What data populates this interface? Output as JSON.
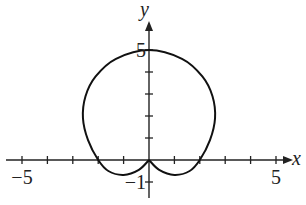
{
  "chart_data": {
    "type": "line",
    "title": "",
    "xlabel": "x",
    "ylabel": "y",
    "xlim": [
      -5,
      5
    ],
    "ylim": [
      -1,
      5
    ],
    "x_ticks": [
      -5,
      -4,
      -3,
      -2,
      -1,
      1,
      2,
      3,
      4,
      5
    ],
    "y_ticks": [
      -1,
      1,
      2,
      3,
      4,
      5
    ],
    "x_tick_labels": [
      {
        "value": -5,
        "text": "−5"
      },
      {
        "value": 5,
        "text": "5"
      }
    ],
    "y_tick_labels": [
      {
        "value": -1,
        "text": "−1"
      },
      {
        "value": 5,
        "text": "5"
      }
    ],
    "grid": false,
    "legend": "none",
    "series": [
      {
        "name": "polar curve",
        "closed": true,
        "points": [
          [
            0,
            0
          ],
          [
            0.4,
            -0.45
          ],
          [
            1.0,
            -0.68
          ],
          [
            1.6,
            -0.5
          ],
          [
            2.0,
            0
          ],
          [
            2.4,
            0.9
          ],
          [
            2.6,
            1.9
          ],
          [
            2.5,
            2.9
          ],
          [
            2.1,
            3.8
          ],
          [
            1.3,
            4.6
          ],
          [
            0,
            5
          ],
          [
            -1.3,
            4.6
          ],
          [
            -2.1,
            3.8
          ],
          [
            -2.5,
            2.9
          ],
          [
            -2.6,
            1.9
          ],
          [
            -2.4,
            0.9
          ],
          [
            -2.0,
            0
          ],
          [
            -1.6,
            -0.5
          ],
          [
            -1.0,
            -0.68
          ],
          [
            -0.4,
            -0.45
          ],
          [
            0,
            0
          ]
        ]
      }
    ]
  }
}
